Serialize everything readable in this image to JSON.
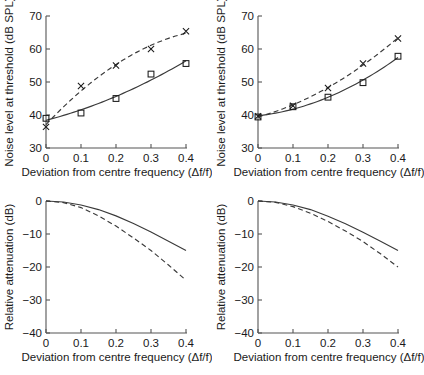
{
  "figure": {
    "panels": [
      "top-left",
      "top-right",
      "bottom-left",
      "bottom-right"
    ]
  },
  "axes": {
    "x_title": "Deviation from centre frequency (Δf/f)",
    "x_ticks": [
      "0",
      "0.1",
      "0.2",
      "0.3",
      "0.4"
    ],
    "x_tick_values": [
      0,
      0.1,
      0.2,
      0.3,
      0.4
    ],
    "y_title_top": "Noise level at threshold (dB SPL)",
    "y_ticks_top": [
      "30",
      "40",
      "50",
      "60",
      "70"
    ],
    "y_tick_values_top": [
      30,
      40,
      50,
      60,
      70
    ],
    "y_title_bottom": "Relative attenuation (dB)",
    "y_ticks_bottom": [
      "0",
      "−10",
      "−20",
      "−30",
      "−40"
    ],
    "y_tick_values_bottom": [
      0,
      -10,
      -20,
      -30,
      -40
    ]
  },
  "chart_data": [
    {
      "type": "scatter",
      "panel": "top-left",
      "title": "",
      "xlabel": "Deviation from centre frequency (Δf/f)",
      "ylabel": "Noise level at threshold (dB SPL)",
      "xlim": [
        0,
        0.4
      ],
      "ylim": [
        30,
        70
      ],
      "grid": false,
      "legend": "none",
      "x": [
        0,
        0.1,
        0.2,
        0.3,
        0.4
      ],
      "series": [
        {
          "name": "square-markers",
          "marker": "square",
          "line": "solid",
          "values": [
            39.0,
            40.6,
            45.0,
            52.4,
            55.6
          ],
          "fit_endpoints": [
            38.2,
            55.6
          ]
        },
        {
          "name": "cross-markers",
          "marker": "cross",
          "line": "dashed",
          "values": [
            36.4,
            48.8,
            55.0,
            60.0,
            65.4
          ],
          "fit_endpoints": [
            40.1,
            67.0
          ]
        }
      ]
    },
    {
      "type": "scatter",
      "panel": "top-right",
      "title": "",
      "xlabel": "Deviation from centre frequency (Δf/f)",
      "ylabel": "Noise level at threshold (dB SPL)",
      "xlim": [
        0,
        0.4
      ],
      "ylim": [
        30,
        70
      ],
      "grid": false,
      "legend": "none",
      "x": [
        0,
        0.1,
        0.2,
        0.3,
        0.4
      ],
      "series": [
        {
          "name": "square-markers",
          "marker": "square",
          "line": "solid",
          "values": [
            39.4,
            42.5,
            45.4,
            49.8,
            57.8
          ],
          "fit_endpoints": [
            38.6,
            57.6
          ]
        },
        {
          "name": "cross-markers",
          "marker": "cross",
          "line": "dashed",
          "values": [
            39.6,
            42.8,
            48.2,
            55.6,
            63.2
          ],
          "fit_endpoints": [
            38.8,
            63.4
          ]
        }
      ]
    },
    {
      "type": "line",
      "panel": "bottom-left",
      "title": "",
      "xlabel": "Deviation from centre frequency (Δf/f)",
      "ylabel": "Relative attenuation (dB)",
      "xlim": [
        0,
        0.4
      ],
      "ylim": [
        -40,
        0
      ],
      "grid": false,
      "legend": "none",
      "x": [
        0,
        0.05,
        0.1,
        0.15,
        0.2,
        0.25,
        0.3,
        0.35,
        0.4
      ],
      "series": [
        {
          "name": "solid-curve",
          "line": "solid",
          "values": [
            0,
            -0.3,
            -1.2,
            -2.6,
            -4.5,
            -6.8,
            -9.4,
            -12.2,
            -15.0
          ]
        },
        {
          "name": "dashed-curve",
          "line": "dashed",
          "values": [
            0,
            -0.5,
            -2.0,
            -4.5,
            -7.6,
            -11.2,
            -15.0,
            -19.4,
            -24.0
          ]
        }
      ]
    },
    {
      "type": "line",
      "panel": "bottom-right",
      "title": "",
      "xlabel": "Deviation from centre frequency (Δf/f)",
      "ylabel": "Relative attenuation (dB)",
      "xlim": [
        0,
        0.4
      ],
      "ylim": [
        -40,
        0
      ],
      "grid": false,
      "legend": "none",
      "x": [
        0,
        0.05,
        0.1,
        0.15,
        0.2,
        0.25,
        0.3,
        0.35,
        0.4
      ],
      "series": [
        {
          "name": "solid-curve",
          "line": "solid",
          "values": [
            0,
            -0.3,
            -1.2,
            -2.6,
            -4.6,
            -6.9,
            -9.5,
            -12.2,
            -15.0
          ]
        },
        {
          "name": "dashed-curve",
          "line": "dashed",
          "values": [
            0,
            -0.4,
            -1.7,
            -3.7,
            -6.2,
            -9.1,
            -12.3,
            -16.0,
            -20.0
          ]
        }
      ]
    }
  ]
}
